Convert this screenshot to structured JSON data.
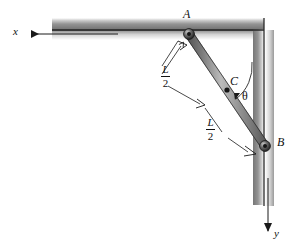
{
  "figure": {
    "type": "engineering-mechanics-diagram",
    "background_color": "#ffffff",
    "ink_color": "#1a1a1a",
    "wall_shade_dark": "#7d7d7d",
    "wall_shade_light": "#f2f2f2",
    "bar_color_mid": "#9a9a9a"
  },
  "axes": {
    "x": {
      "label": "x",
      "direction": "left",
      "label_x": 14,
      "label_y": 33
    },
    "y": {
      "label": "y",
      "direction": "down",
      "label_x": 275,
      "label_y": 234
    }
  },
  "points": [
    {
      "id": "A",
      "label": "A",
      "label_x": 184,
      "label_y": 10,
      "px": 189,
      "py": 34,
      "kind": "pin-support"
    },
    {
      "id": "C",
      "label": "C",
      "label_x": 230,
      "label_y": 79,
      "px": 228,
      "py": 93,
      "kind": "midpoint-marker"
    },
    {
      "id": "B",
      "label": "B",
      "label_x": 277,
      "label_y": 140,
      "px": 265,
      "py": 146,
      "kind": "pin-support"
    }
  ],
  "dimensions": [
    {
      "id": "upper-half",
      "numerator": "L",
      "denominator": "2",
      "label_x": 168,
      "label_y": 70
    },
    {
      "id": "lower-half",
      "numerator": "L",
      "denominator": "2",
      "label_x": 212,
      "label_y": 123
    }
  ],
  "angle": {
    "symbol": "θ",
    "label_x": 243,
    "label_y": 96,
    "measured_between": "bar-CB and vertical-wall"
  },
  "bar": {
    "from": "A",
    "to": "B",
    "length_symbol": "L"
  },
  "walls": {
    "horizontal": {
      "from_x": 52,
      "to_x": 262,
      "y": 30,
      "thickness": 11
    },
    "vertical": {
      "x": 262,
      "from_y": 18,
      "to_y": 205,
      "thickness": 11
    }
  }
}
